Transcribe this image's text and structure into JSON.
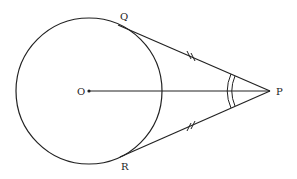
{
  "diagram": {
    "labels": {
      "center": "O",
      "external_point": "P",
      "tangent_point_top": "Q",
      "tangent_point_bottom": "R"
    },
    "circle": {
      "cx": 89,
      "cy": 91,
      "r": 73
    },
    "points": {
      "O": [
        89,
        91
      ],
      "P": [
        270,
        91
      ],
      "Q": [
        131,
        31
      ],
      "R": [
        131,
        151
      ]
    },
    "annotations": {
      "equal_length_marks": "PQ = PR (double tick marks)",
      "equal_angle_marks": "angle QPO = angle RPO (double arcs)"
    },
    "stroke_color": "#222222"
  }
}
